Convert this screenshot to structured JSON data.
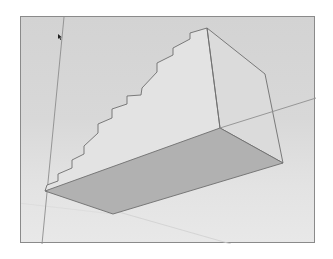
{
  "app": {
    "view": "3D modeling viewport",
    "scene_description": "Rectangular block with stepped (staircase) profile on its side face, shown from below in perspective"
  },
  "colors": {
    "background_sky": "#d3d3d3",
    "background_ground": "#e6e6e6",
    "frame_border": "#8a8a8a",
    "face_side_light": "#e4e4e4",
    "face_end": "#dcdcdc",
    "face_bottom": "#b0b0b0",
    "edge": "#6e6e6e",
    "axis_line": "#9a9a9a"
  },
  "geometry": {
    "staircase_steps": 10,
    "staircase_points": "46,184 57,180 57,173 71,167 71,159 83,153 83,145 97,132 97,123 111,117 111,108 126,103 126,95 140,94 141,87 156,71 156,62 172,54 172,47 189,38 189,32 206,27",
    "side_face": "44,190 46,184 57,180 57,173 71,167 71,159 83,153 83,145 97,132 97,123 111,117 111,108 126,103 126,95 140,94 141,87 156,71 156,62 172,54 172,47 189,38 189,32 206,27 219,127",
    "end_face": "206,27 264,73 282,162 219,127",
    "bottom_face": "44,190 219,127 282,162 112,213",
    "axes": {
      "green_axis": "63,16 41,243",
      "red_axis": "219,127 315,97",
      "blue_axis_faint": "44,190 315,243"
    }
  },
  "cursor": {
    "x": 57,
    "y": 34,
    "icon": "arrow-pointer-icon"
  }
}
